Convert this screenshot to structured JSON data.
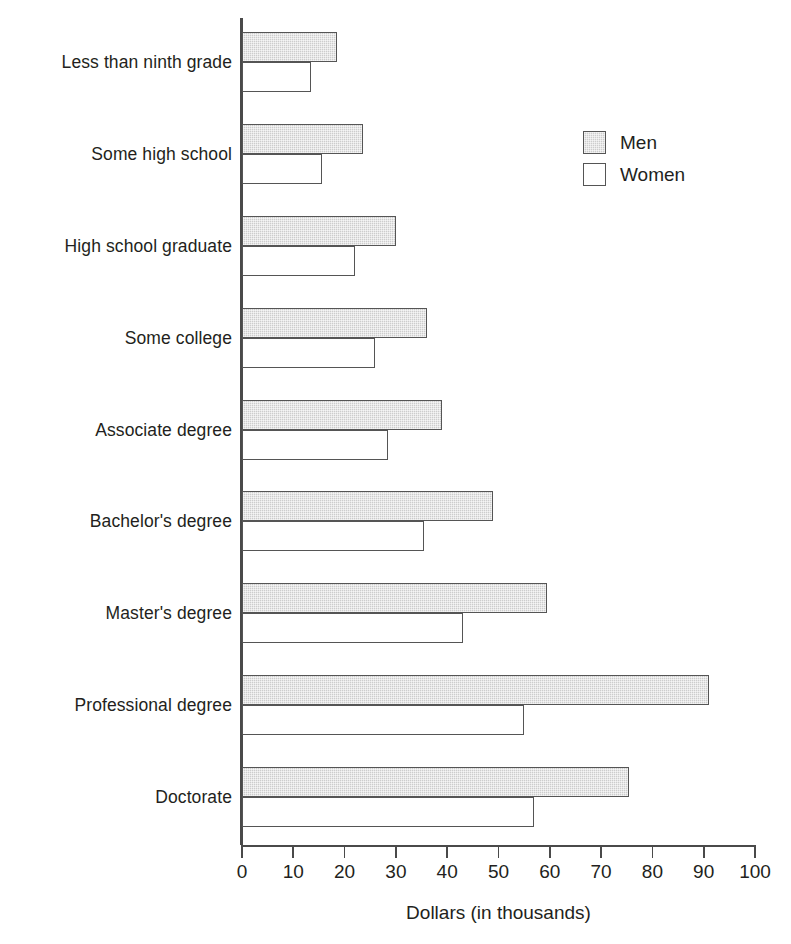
{
  "chart_data": {
    "type": "bar",
    "orientation": "horizontal",
    "title": "",
    "xlabel": "Dollars (in thousands)",
    "ylabel": "",
    "xlim": [
      0,
      100
    ],
    "xticks": [
      0,
      10,
      20,
      30,
      40,
      50,
      60,
      70,
      80,
      90,
      100
    ],
    "xtick_labels": [
      "0",
      "10",
      "20",
      "30",
      "40",
      "50",
      "60",
      "70",
      "80",
      "90",
      "100"
    ],
    "grid": false,
    "legend_position": "top-right",
    "categories": [
      "Less than ninth grade",
      "Some high school",
      "High school graduate",
      "Some college",
      "Associate degree",
      "Bachelor's degree",
      "Master's degree",
      "Professional degree",
      "Doctorate"
    ],
    "series": [
      {
        "name": "Men",
        "color": "#cdcdcd",
        "values": [
          18.5,
          23.5,
          30,
          36,
          39,
          49,
          59.5,
          91,
          75.5
        ]
      },
      {
        "name": "Women",
        "color": "#ffffff",
        "values": [
          13.5,
          15.5,
          22,
          26,
          28.5,
          35.5,
          43,
          55,
          57
        ]
      }
    ]
  },
  "legend": {
    "entries": [
      {
        "label": "Men"
      },
      {
        "label": "Women"
      }
    ]
  }
}
